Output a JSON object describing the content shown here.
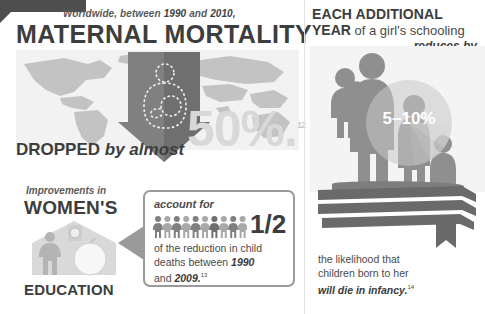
{
  "meta": {
    "accent_dark": "#3d3d3d",
    "accent_mid": "#808080",
    "accent_light": "#d8d8d8",
    "background": "#ffffff"
  },
  "left_panel": {
    "kicker_prefix": "Worldwide, between ",
    "kicker_year_from": "1990",
    "kicker_middle": " and ",
    "kicker_year_to": "2010,",
    "title": "MATERNAL MORTALITY",
    "dropped_word": "DROPPED",
    "dropped_rest": " by almost",
    "big_stat": "50%.",
    "big_stat_footnote": "12",
    "map_icon": "world-map",
    "arrow_icon": "down-arrow",
    "mother_icon": "mother-and-baby-icon"
  },
  "education_panel": {
    "kicker": "Improvements in",
    "line1": "WOMEN'S",
    "line2": "EDUCATION",
    "art_icon": "schoolhouse-woman-apple-icon"
  },
  "callout": {
    "lead": "account for",
    "fraction": "1/2",
    "people_icon": "people-row-icon",
    "people_count": 10,
    "people_highlighted": 5,
    "body_line1": "of the reduction in child",
    "body_line2_prefix": "deaths between ",
    "body_line2_year": "1990",
    "body_line3_prefix": "and ",
    "body_line3_year": "2009.",
    "body_footnote": "13",
    "arrow_icon": "left-pointer-arrow"
  },
  "right_panel": {
    "title_line1": "EACH ADDITIONAL",
    "title_line2_strong": "YEAR",
    "title_line2_rest": " of a girl's schooling",
    "reduces_by": "reduces by",
    "percent": "5–10%",
    "silhouette_icon": "family-silhouette-icon",
    "pie_icon": "pie-chart-overlay",
    "books_icon": "stacked-books-icon",
    "body_line1": "the likelihood that",
    "body_line2": "children born to her",
    "body_line3_italic": "will die in infancy.",
    "body_footnote": "14"
  }
}
